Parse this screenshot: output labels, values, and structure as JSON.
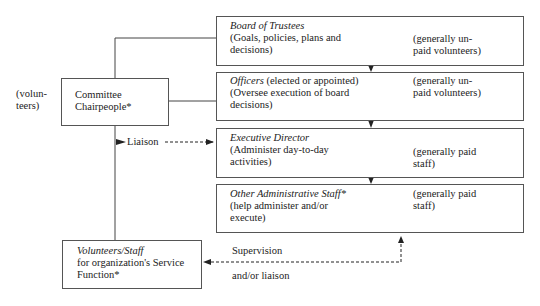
{
  "side_label": [
    "(volun-",
    "teers)"
  ],
  "committee": {
    "line1": "Committee",
    "line2": "Chairpeople*"
  },
  "liaison_label": "Liaison",
  "board": {
    "title": "Board of Trustees",
    "desc1": "(Goals, policies, plans and",
    "desc2": "decisions)",
    "note1": "(generally un-",
    "note2": "paid volunteers)"
  },
  "officers": {
    "title": "Officers",
    "title_rest": " (elected or appointed)",
    "desc1": "(Oversee execution of board",
    "desc2": "decisions)",
    "note1": "(generally un-",
    "note2": "paid volunteers)"
  },
  "executive": {
    "title": "Executive Director",
    "desc1": "(Administer day-to-day",
    "desc2": "activities)",
    "note1": "(generally paid",
    "note2": "staff)"
  },
  "other_staff": {
    "title": "Other Administrative Staff*",
    "desc1": "(help administer and/or",
    "desc2": "execute)",
    "note1": "(generally paid",
    "note2": "staff)"
  },
  "volunteers": {
    "title": "Volunteers/Staff",
    "desc1": "for organization's Service",
    "desc2": "Function*"
  },
  "supervision": {
    "line1": "Supervision",
    "line2": "and/or liaison"
  }
}
